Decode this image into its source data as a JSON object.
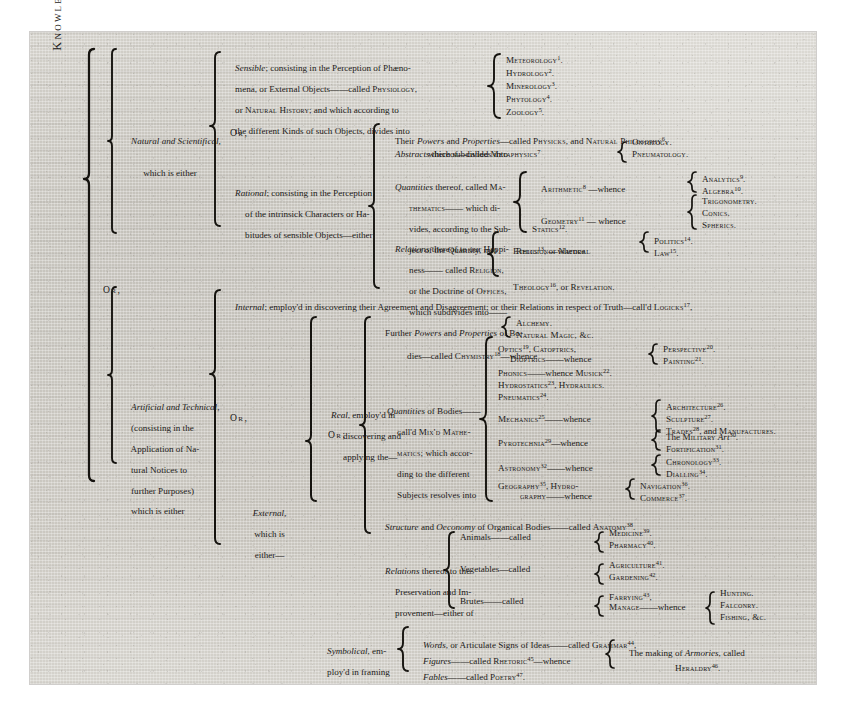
{
  "root": {
    "label": "Knowledge, is either"
  },
  "connectors": {
    "or1": "Or,",
    "or2": "Or,",
    "or3": "Or,",
    "or4": "Or;",
    "or5": "Or;"
  },
  "branch_natural": {
    "label_line1": "Natural and Scientifical,",
    "label_line2": "which is either",
    "sensible": {
      "lines": [
        "Sensible; consisting in the Perception of Phæno-",
        "mena, or External Objects——called Physiology,",
        "or Natural History; and which according to",
        "the different Kinds of such Objects, divides into"
      ],
      "items": [
        {
          "name": "Meteorology",
          "note": "1"
        },
        {
          "name": "Hydrology",
          "note": "2"
        },
        {
          "name": "Minerology",
          "note": "3"
        },
        {
          "name": "Phytology",
          "note": "4"
        },
        {
          "name": "Zoology",
          "note": "5"
        }
      ]
    },
    "rational": {
      "lines": [
        "Rational; consisting in the Perception",
        "of the intrinsick Characters or Ha-",
        "bitudes of sensible Objects—either"
      ],
      "powers": {
        "text_a": "Their ",
        "text_b": "Powers",
        "text_c": " and ",
        "text_d": "Properties",
        "text_e": "—called Physicks, and Natural Philosophy",
        "note": "6"
      },
      "abstracts": {
        "line1_a": "Abstracts",
        "line1_b": " thereof—called Metaphysics",
        "line1_note": "7",
        "line2": "which subdivides into",
        "items": [
          "Ontology.",
          "Pneumatology."
        ]
      },
      "quantities": {
        "lines": [
          "Quantities thereof, called Ma-",
          "thematics—— which di-",
          "vides, according to the Sub-",
          "ject of the Quantity, into"
        ],
        "groups": [
          {
            "head": "Arithmetic",
            "head_note": "8",
            "link": "—whence",
            "items": [
              {
                "name": "Analytics",
                "note": "9"
              },
              {
                "name": "Algebra",
                "note": "10"
              }
            ]
          },
          {
            "head": "Geometry",
            "head_note": "11",
            "link": "— whence",
            "items": [
              {
                "name": "Trigonometry.",
                "note": ""
              },
              {
                "name": "Conics.",
                "note": ""
              },
              {
                "name": "Spherics.",
                "note": ""
              }
            ]
          }
        ],
        "statics": {
          "name": "Statics",
          "note": "12"
        }
      },
      "relations": {
        "lines": [
          "Relations thereof to our Happi-",
          "ness—— called Religion,",
          "or the Doctrine of Offices,",
          "which subdivides into——"
        ],
        "ethics": {
          "line1_a": "Ethics",
          "line1_note": "13",
          "line1_b": ", or Natural",
          "line2": "Religion—whence",
          "items": [
            {
              "name": "Politics",
              "note": "14"
            },
            {
              "name": "Law",
              "note": "15"
            }
          ]
        },
        "theology": {
          "text_a": "Theology ",
          "note": "16",
          "text_b": ", or Revelation."
        }
      }
    }
  },
  "branch_artificial": {
    "label_lines": [
      "Artificial and Technical,",
      "(consisting in the",
      "Application of Na-",
      "tural Notices to",
      "further Purposes)",
      "which is either"
    ],
    "internal": {
      "text_a": "Internal",
      "text_b": "; employ'd in discovering their Agreement and Disagreement; or their Relations in respect of Truth—call'd Logicks",
      "note": "17"
    },
    "external": {
      "label_line1": "External,",
      "label_line2": "which is",
      "label_line3": "either—",
      "real": {
        "label_lines": [
          "Real, employ'd in",
          "discovering and",
          "applying the—"
        ],
        "chymistry": {
          "lines": [
            "Further Powers and Properties of Bo-",
            "dies—called Chymistry"
          ],
          "note": "18",
          "link": "—whence",
          "items": [
            "Alchemy.",
            "Natural Magic, &c."
          ]
        },
        "mixed_math": {
          "lines": [
            "Quantities of Bodies——",
            "call'd Mix'd Mathe-",
            "matics; which accor-",
            "ding to the different",
            "Subjects resolves into"
          ],
          "plain": [
            {
              "text_a": "Optics ",
              "note": "19",
              "text_b": ", Catoptrics,",
              "text_c": ""
            },
            {
              "text_a": "Dioptrics——whence",
              "note": "",
              "text_b": "",
              "text_c": ""
            },
            {
              "text_a": "Phonics——whence Musick ",
              "note": "22",
              "text_b": ".",
              "text_c": ""
            },
            {
              "text_a": "Hydrostatics ",
              "note": "23",
              "text_b": ", Hydraulics.",
              "text_c": ""
            },
            {
              "text_a": "Pneumatics ",
              "note": "24",
              "text_b": ".",
              "text_c": ""
            }
          ],
          "optics_out": [
            {
              "name": "Perspective",
              "note": "20"
            },
            {
              "name": "Painting",
              "note": "21"
            }
          ],
          "groups": [
            {
              "head": "Mechanics",
              "head_note": "25",
              "link": "——whence",
              "items": [
                {
                  "name": "Architecture",
                  "note": "26"
                },
                {
                  "name": "Sculpture",
                  "note": "27"
                },
                {
                  "name": "Trades",
                  "note": "28",
                  "tail": ", and Manufactures."
                }
              ]
            },
            {
              "head": "Pyrotechnia",
              "head_note": "29",
              "link": "—whence",
              "items": [
                {
                  "name": "The Military Art",
                  "note": "30"
                },
                {
                  "name": "Fortification",
                  "note": "31"
                }
              ]
            },
            {
              "head": "Astronomy",
              "head_note": "32",
              "link": "——whence",
              "items": [
                {
                  "name": "Chronology",
                  "note": "33"
                },
                {
                  "name": "Dialling",
                  "note": "34"
                }
              ]
            },
            {
              "head": "Geography",
              "head_note": "35",
              "link": "—whence",
              "head_line2": "graphy——",
              "head_tail": ", Hydro-",
              "items": [
                {
                  "name": "Navigation",
                  "note": "36"
                },
                {
                  "name": "Commerce",
                  "note": "37"
                }
              ]
            }
          ]
        },
        "anatomy": {
          "text_a": "Structure",
          "text_b": " and ",
          "text_c": "Oeconomy",
          "text_d": " of Organical Bodies——called Anatomy ",
          "note": "38"
        },
        "relations": {
          "lines": [
            "Relations thereof to the",
            "Preservation and Im-",
            "provement—either of"
          ],
          "rows": [
            {
              "subject": "Animals——called",
              "items": [
                {
                  "name": "Medicine",
                  "note": "39"
                },
                {
                  "name": "Pharmacy",
                  "note": "40"
                }
              ]
            },
            {
              "subject": "Vegetables—called",
              "items": [
                {
                  "name": "Agriculture",
                  "note": "41"
                },
                {
                  "name": "Gardening",
                  "note": "42"
                }
              ]
            },
            {
              "subject": "Brutes——called",
              "items": [
                {
                  "name": "Farrying",
                  "note": "43"
                },
                {
                  "name": "Manage——whence",
                  "note": ""
                }
              ],
              "tail_items": [
                "Hunting.",
                "Falconry.",
                "Fishing, &c."
              ]
            }
          ]
        }
      },
      "symbolical": {
        "label_line1": "Symbolical, em-",
        "label_line2": "ploy'd in framing",
        "rows": [
          {
            "text_a": "Words",
            "text_b": ", or Articulate Signs of Ideas——called Grammar ",
            "note": "44",
            "text_c": "."
          },
          {
            "text_a": "Figures",
            "text_b": "——called Rhetoric ",
            "note": "45",
            "text_c": "—whence"
          },
          {
            "text_a": "Fables",
            "text_b": "——called Poetry ",
            "note": "47",
            "text_c": "."
          }
        ],
        "heraldry": {
          "line1_a": "The making of ",
          "line1_b": "Armories",
          "line1_c": ", called",
          "line2": "Heraldry ",
          "note": "46",
          "line2_tail": "."
        }
      }
    }
  }
}
